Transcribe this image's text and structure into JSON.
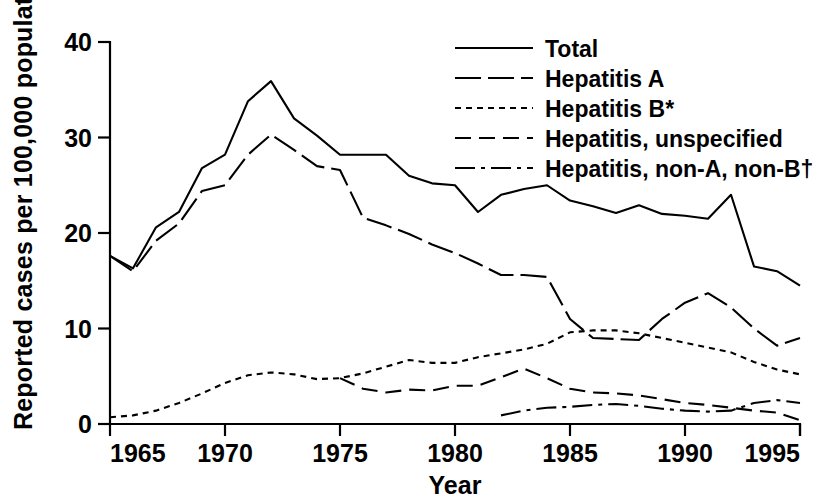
{
  "chart_data": {
    "type": "line",
    "title": "",
    "xlabel": "Year",
    "ylabel": "Reported cases per 100,000 population",
    "xlim": [
      1965,
      1995
    ],
    "ylim": [
      0,
      40
    ],
    "yticks": [
      "0",
      "10",
      "20",
      "30",
      "40"
    ],
    "ytick_values": [
      0,
      10,
      20,
      30,
      40
    ],
    "xticks": [
      "1965",
      "1970",
      "1975",
      "1980",
      "1985",
      "1990",
      "1995"
    ],
    "xtick_values": [
      1965,
      1970,
      1975,
      1980,
      1985,
      1990,
      1995
    ],
    "grid": false,
    "legend_position": "top-right",
    "x": [
      1965,
      1966,
      1967,
      1968,
      1969,
      1970,
      1971,
      1972,
      1973,
      1974,
      1975,
      1976,
      1977,
      1978,
      1979,
      1980,
      1981,
      1982,
      1983,
      1984,
      1985,
      1986,
      1987,
      1988,
      1989,
      1990,
      1991,
      1992,
      1993,
      1994,
      1995
    ],
    "series": [
      {
        "name": "Total",
        "style": "solid",
        "values": [
          17.6,
          16.3,
          20.6,
          22.2,
          26.8,
          28.2,
          33.8,
          35.9,
          32.0,
          30.2,
          28.2,
          28.2,
          28.2,
          26.0,
          25.2,
          25.0,
          22.2,
          24.0,
          24.6,
          25.0,
          23.4,
          22.8,
          22.1,
          22.9,
          22.0,
          21.8,
          21.5,
          24.0,
          16.5,
          16.0,
          14.5
        ]
      },
      {
        "name": "Hepatitis A",
        "style": "long-dash",
        "values": [
          17.6,
          16.0,
          19.2,
          21.0,
          24.4,
          25.0,
          28.2,
          30.3,
          28.7,
          27.0,
          26.6,
          21.6,
          20.8,
          19.9,
          18.8,
          17.9,
          16.8,
          15.6,
          15.6,
          15.4,
          11.0,
          9.0,
          8.9,
          8.8,
          11.0,
          12.7,
          13.7,
          12.2,
          10.0,
          8.2,
          9.0
        ]
      },
      {
        "name": "Hepatitis B*",
        "style": "dotted",
        "values": [
          0.7,
          0.9,
          1.4,
          2.2,
          3.2,
          4.3,
          5.1,
          5.4,
          5.2,
          4.7,
          4.8,
          5.3,
          6.0,
          6.7,
          6.4,
          6.4,
          7.0,
          7.4,
          7.8,
          8.4,
          9.6,
          9.8,
          9.8,
          9.5,
          9.0,
          8.5,
          8.0,
          7.5,
          6.5,
          5.7,
          5.2
        ]
      },
      {
        "name": "Hepatitis, unspecified",
        "style": "dashed",
        "values": [
          null,
          null,
          null,
          null,
          null,
          null,
          null,
          null,
          null,
          null,
          4.8,
          3.7,
          3.3,
          3.6,
          3.5,
          4.0,
          4.0,
          4.9,
          5.8,
          4.8,
          3.7,
          3.3,
          3.2,
          3.0,
          2.6,
          2.2,
          2.0,
          1.7,
          1.4,
          1.2,
          0.4
        ]
      },
      {
        "name": "Hepatitis, non-A, non-B†",
        "style": "dash-dot",
        "values": [
          null,
          null,
          null,
          null,
          null,
          null,
          null,
          null,
          null,
          null,
          null,
          null,
          null,
          null,
          null,
          null,
          null,
          0.9,
          1.4,
          1.7,
          1.8,
          2.0,
          2.1,
          1.9,
          1.6,
          1.4,
          1.3,
          1.4,
          2.2,
          2.5,
          2.2
        ]
      }
    ]
  },
  "legend": {
    "items": [
      {
        "label": "Total",
        "key": "legend-item-total"
      },
      {
        "label": "Hepatitis A",
        "key": "legend-item-hepatitis-a"
      },
      {
        "label": "Hepatitis B*",
        "key": "legend-item-hepatitis-b"
      },
      {
        "label": "Hepatitis, unspecified",
        "key": "legend-item-hepatitis-unspecified"
      },
      {
        "label": "Hepatitis, non-A, non-B†",
        "key": "legend-item-hepatitis-nonanonb"
      }
    ]
  },
  "colors": {
    "line": "#000000",
    "axis": "#000000",
    "background": "#ffffff"
  }
}
